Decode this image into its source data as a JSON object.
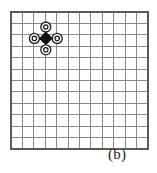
{
  "figure": {
    "caption": "(b)",
    "type": "lattice-diagram",
    "grid": {
      "columns": 12,
      "rows": 12,
      "origin_x": 11,
      "origin_y": 12,
      "cell_width": 11.4,
      "cell_height": 11.4,
      "line_color": "#8a8a8a",
      "border_color": "#5a5a5a",
      "line_width": 1,
      "border_width": 1.4,
      "background_color": "#ffffff"
    },
    "markers": {
      "center": {
        "name": "diamond-marker",
        "shape": "diamond",
        "fill_color": "#101010",
        "grid_col": 3,
        "grid_row": 2,
        "cx": 45.8,
        "cy": 38.4,
        "radius": 6.4
      },
      "neighbours": [
        {
          "name": "circle-marker-up",
          "shape": "ring",
          "grid_col": 3,
          "grid_row": 1,
          "cx": 45.8,
          "cy": 27.0,
          "outer_radius": 5.0,
          "inner_radius": 2.2,
          "stroke_color": "#1a1a1a",
          "fill_color": "#ffffff"
        },
        {
          "name": "circle-marker-right",
          "shape": "ring",
          "grid_col": 4,
          "grid_row": 2,
          "cx": 57.2,
          "cy": 38.4,
          "outer_radius": 5.0,
          "inner_radius": 2.2,
          "stroke_color": "#1a1a1a",
          "fill_color": "#ffffff"
        },
        {
          "name": "circle-marker-down",
          "shape": "ring",
          "grid_col": 3,
          "grid_row": 3,
          "cx": 45.8,
          "cy": 49.8,
          "outer_radius": 5.0,
          "inner_radius": 2.2,
          "stroke_color": "#1a1a1a",
          "fill_color": "#ffffff"
        },
        {
          "name": "circle-marker-left",
          "shape": "ring",
          "grid_col": 2,
          "grid_row": 2,
          "cx": 34.4,
          "cy": 38.4,
          "outer_radius": 5.0,
          "inner_radius": 2.2,
          "stroke_color": "#1a1a1a",
          "fill_color": "#ffffff"
        }
      ]
    }
  }
}
